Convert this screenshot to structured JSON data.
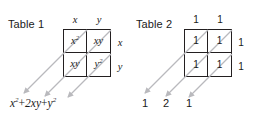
{
  "figure": {
    "background_color": "#ffffff",
    "line_color": "#231f20",
    "arrow_color": "#b9b9bd",
    "text_color": "#1a1a1a"
  },
  "table1": {
    "title": "Table 1",
    "column_headers": [
      "x",
      "y"
    ],
    "row_headers": [
      "x",
      "y"
    ],
    "cells": [
      [
        {
          "base": "x",
          "exp": "2"
        },
        {
          "base": "xy",
          "exp": ""
        }
      ],
      [
        {
          "base": "xy",
          "exp": ""
        },
        {
          "base": "y",
          "exp": "2"
        }
      ]
    ],
    "sum": {
      "term1_base": "x",
      "term1_exp": "2",
      "op1": "+",
      "term2_base": "2xy",
      "term2_exp": "",
      "op2": "+",
      "term3_base": "y",
      "term3_exp": "2"
    }
  },
  "table2": {
    "title": "Table 2",
    "column_headers": [
      "1",
      "1"
    ],
    "row_headers": [
      "1",
      "1"
    ],
    "cells": [
      [
        {
          "base": "1",
          "exp": ""
        },
        {
          "base": "1",
          "exp": ""
        }
      ],
      [
        {
          "base": "1",
          "exp": ""
        },
        {
          "base": "1",
          "exp": ""
        }
      ]
    ],
    "diagonal_sums": [
      "1",
      "2",
      "1"
    ]
  }
}
